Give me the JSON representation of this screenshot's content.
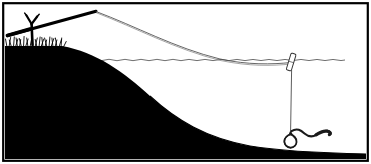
{
  "illustration": {
    "title": "Float fishing rig on a steep bank",
    "style": "black and white line drawing",
    "colors": {
      "ink": "#000000",
      "paper": "#ffffff",
      "line_stroke": "#3a3a3a",
      "frame": "#000000"
    },
    "frame": {
      "label": "picture-frame",
      "stroke_width": 2.2,
      "inset": 3
    },
    "canvas": {
      "width": 371,
      "height": 164
    }
  },
  "scene": {
    "bank": {
      "label": "Steep earth bank and lake bed",
      "fill": "#000000",
      "top_edge_y": 46,
      "toe_x": 250,
      "bottom_y": 155
    },
    "grass": {
      "label": "Grass tufts on bank top",
      "blade_count": 26,
      "start_x": 6,
      "end_x": 62,
      "base_y": 46,
      "max_height": 13
    },
    "rod": {
      "label": "Fishing rod resting on forked stick",
      "butt_x": 8,
      "butt_y": 34,
      "tip_x": 96,
      "tip_y": 11,
      "thickness": 2.6
    },
    "rod_rest": {
      "label": "Forked stick rod rest",
      "stem_x": 32,
      "stem_top_y": 14,
      "stem_bottom_y": 44,
      "fork_span": 9
    },
    "line": {
      "label": "Fishing line from rod tip to float",
      "stroke": "#4a4a4a",
      "stroke_width": 0.8,
      "from_x": 96,
      "from_y": 11,
      "to_x": 292,
      "to_y": 63
    },
    "waterline": {
      "label": "Rippled water surface",
      "start_x": 57,
      "end_x": 366,
      "y": 60,
      "ripple_amplitude": 1.2,
      "ripple_count": 34
    },
    "float": {
      "label": "Quill float / bobber",
      "x": 292,
      "y": 62,
      "length": 17,
      "width": 5,
      "tilt_deg": 18
    },
    "dropper": {
      "label": "Line from float down to hook",
      "x": 292,
      "top_y": 70,
      "bottom_y": 132
    },
    "hook": {
      "label": "Hook with ring eye",
      "x": 290,
      "y": 141,
      "ring_rx": 6,
      "ring_ry": 7
    },
    "bait": {
      "label": "Worm bait on hook",
      "start_x": 292,
      "start_y": 131,
      "end_x": 330,
      "end_y": 135
    }
  },
  "labels": {
    "caption": ""
  }
}
